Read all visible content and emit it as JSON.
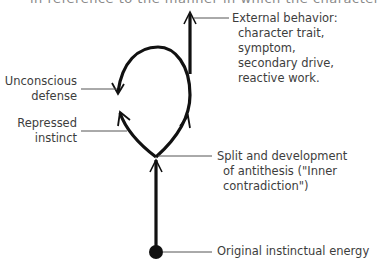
{
  "top_clipped_text": "in reference to the manner in which the character trait",
  "labels": {
    "external_behavior": {
      "title": "External behavior:",
      "lines": [
        "character trait,",
        "symptom,",
        "secondary drive,",
        "reactive work."
      ]
    },
    "unconscious_defense": {
      "lines": [
        "Unconscious",
        "defense"
      ]
    },
    "repressed_instinct": {
      "lines": [
        "Repressed",
        "instinct"
      ]
    },
    "split": {
      "lines": [
        "Split and development",
        "of antithesis (\"Inner",
        "contradiction\")"
      ]
    },
    "original_energy": {
      "text": "Original instinctual energy"
    }
  },
  "colors": {
    "stroke": "#111111",
    "leader": "#555555",
    "text": "#3d3d3d"
  }
}
